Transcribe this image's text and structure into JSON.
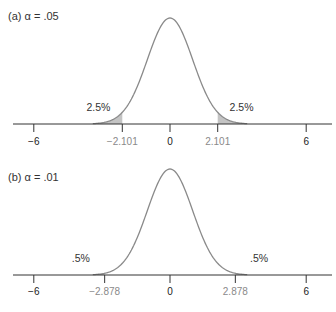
{
  "chart_data": [
    {
      "type": "area",
      "panel_label": "(a)",
      "alpha_symbol": "α",
      "alpha_text": "= .05",
      "title": "(a)  α = .05",
      "distribution": "t (approximately normal)",
      "xlim": [
        -7,
        7
      ],
      "x_ticks": [
        -6,
        -2.101,
        0,
        2.101,
        6
      ],
      "x_tick_labels": [
        "−6",
        "−2.101",
        "0",
        "2.101",
        "6"
      ],
      "critical_value": 2.101,
      "tail_labels": [
        "2.5%",
        "2.5%"
      ],
      "tail_area_each": 0.025,
      "shaded_tails": true,
      "grid": false,
      "xlabel": "",
      "ylabel": ""
    },
    {
      "type": "area",
      "panel_label": "(b)",
      "alpha_symbol": "α",
      "alpha_text": "= .01",
      "title": "(b)  α = .01",
      "distribution": "t (approximately normal)",
      "xlim": [
        -7,
        7
      ],
      "x_ticks": [
        -6,
        -2.878,
        0,
        2.878,
        6
      ],
      "x_tick_labels": [
        "−6",
        "−2.878",
        "0",
        "2.878",
        "6"
      ],
      "critical_value": 2.878,
      "tail_labels": [
        ".5%",
        ".5%"
      ],
      "tail_area_each": 0.005,
      "shaded_tails": true,
      "grid": false,
      "xlabel": "",
      "ylabel": ""
    }
  ],
  "colors": {
    "curve": "#8a8a8a",
    "axis": "#333333",
    "tail_fill": "#c4c4c4",
    "tick_label": "#222222",
    "critical_label": "#8a8a8a",
    "text": "#333333"
  },
  "layout": {
    "px_per_unit": 22.7,
    "center_x": 170,
    "curve_height": 106,
    "sigma": 1.0,
    "panels": [
      {
        "axis_y": 124,
        "title_y": 20,
        "tail_label_y": 111,
        "tick_label_y": 145
      },
      {
        "axis_y": 275,
        "title_y": 181,
        "tail_label_y": 262,
        "tick_label_y": 295
      }
    ]
  }
}
